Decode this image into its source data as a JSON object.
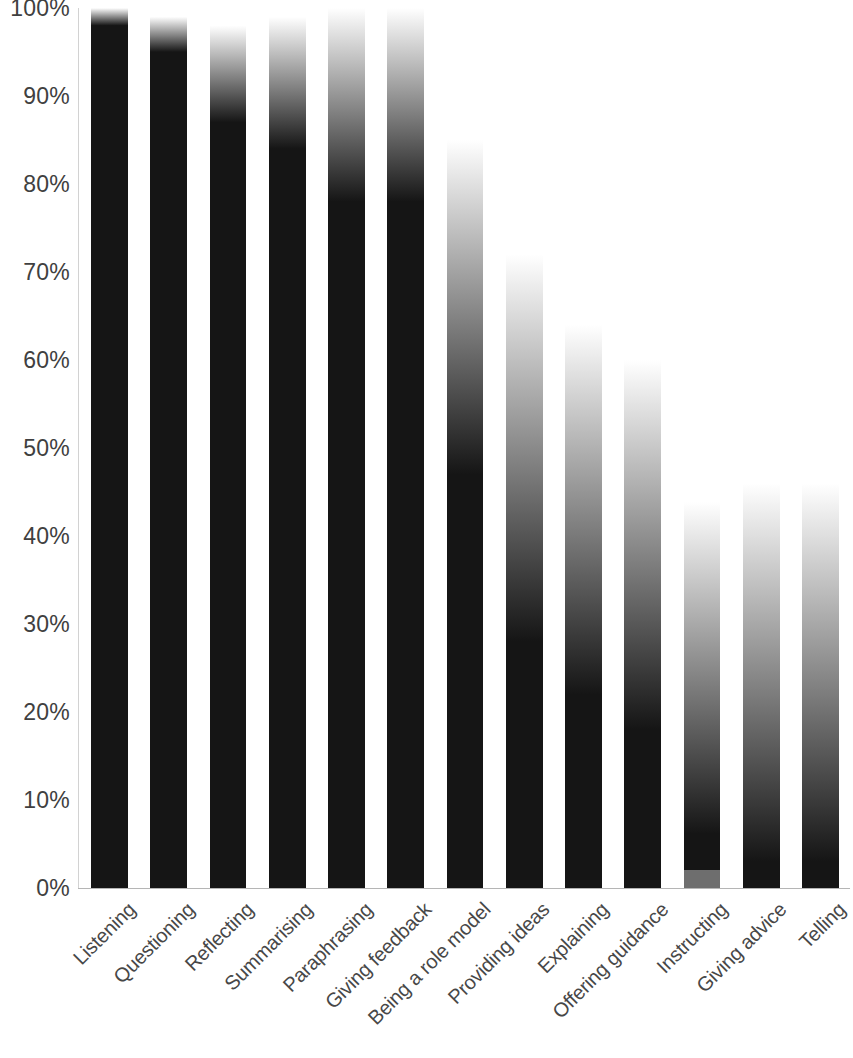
{
  "chart_data": {
    "type": "bar",
    "title": "",
    "subtitle": "",
    "xlabel": "",
    "ylabel": "",
    "ylim": [
      0,
      100
    ],
    "grid": false,
    "legend": "none",
    "y_tick_labels": [
      "100%",
      "90%",
      "80%",
      "70%",
      "60%",
      "50%",
      "40%",
      "30%",
      "20%",
      "10%",
      "0%"
    ],
    "y_tick_values": [
      100,
      90,
      80,
      70,
      60,
      50,
      40,
      30,
      20,
      10,
      0
    ],
    "categories": [
      "Listening",
      "Questioning",
      "Reflecting",
      "Summarising",
      "Paraphrasing",
      "Giving feedback",
      "Being a role model",
      "Providing ideas",
      "Explaining",
      "Offering guidance",
      "Instructing",
      "Giving advice",
      "Telling"
    ],
    "values": [
      100,
      100,
      100,
      100,
      100,
      100,
      100,
      100,
      100,
      100,
      98,
      100,
      100
    ],
    "series": [
      {
        "name": "Proportion",
        "values": [
          100,
          100,
          100,
          100,
          100,
          100,
          100,
          100,
          100,
          100,
          98,
          100,
          100
        ]
      }
    ],
    "bar_shading": {
      "description": "Each bar is a vertical white-to-black gradient; the gradient's solid-black onset descends progressively from left to right.",
      "solid_black_onset_percent": [
        98,
        95,
        87,
        84,
        78,
        78,
        47,
        28,
        22,
        18,
        6,
        3,
        3
      ],
      "white_top_percent": [
        100,
        99,
        98,
        99,
        100,
        100,
        85,
        72,
        64,
        60,
        43,
        46,
        46
      ],
      "top_color": "#ffffff",
      "bottom_color": "#151515"
    },
    "colors": {
      "bar_dark": "#151515",
      "bar_light": "#ffffff",
      "axis_line": "#b5b5b5",
      "tick_text": "#404040",
      "category_text": "#474747",
      "background": "#ffffff"
    },
    "notes": {
      "instructing_base_segment": "Small lighter grey segment at the base of the Instructing bar, roughly 0-2%."
    }
  }
}
